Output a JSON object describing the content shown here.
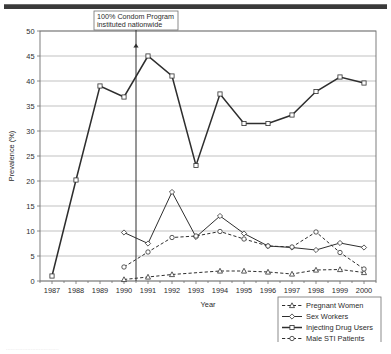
{
  "figure": {
    "top_rule": "horizontal-rule",
    "caption_fragment": "................................"
  },
  "chart_data": {
    "type": "line",
    "title": "",
    "xlabel": "Year",
    "ylabel": "Prevalence (%)",
    "x": [
      1987,
      1988,
      1989,
      1990,
      1991,
      1992,
      1993,
      1994,
      1995,
      1996,
      1997,
      1998,
      1999,
      2000
    ],
    "xtick_labels": [
      "1987",
      "1988",
      "1989",
      "1990",
      "1991",
      "1992",
      "1993",
      "1994",
      "1995",
      "1996",
      "1997",
      "1998",
      "1999",
      "2000"
    ],
    "ylim": [
      0,
      50
    ],
    "ytick_values": [
      0,
      5,
      10,
      15,
      20,
      25,
      30,
      35,
      40,
      45,
      50
    ],
    "ytick_labels": [
      "0",
      "5",
      "10",
      "15",
      "20",
      "25",
      "30",
      "35",
      "40",
      "45",
      "50"
    ],
    "grid": "horizontal",
    "legend_position": "bottom-right",
    "series": [
      {
        "name": "Pregnant Women",
        "marker": "triangle",
        "dash": "dashed",
        "x": [
          1990,
          1991,
          1992,
          1994,
          1995,
          1996,
          1997,
          1998,
          1999,
          2000
        ],
        "values": [
          0.3,
          0.8,
          1.3,
          2.0,
          2.0,
          1.8,
          1.4,
          2.2,
          2.3,
          1.7
        ]
      },
      {
        "name": "Sex Workers",
        "marker": "diamond",
        "dash": "solid",
        "x": [
          1990,
          1991,
          1992,
          1993,
          1994,
          1995,
          1996,
          1997,
          1998,
          1999,
          2000
        ],
        "values": [
          9.7,
          7.5,
          17.8,
          8.8,
          13.0,
          9.5,
          7.0,
          6.7,
          6.2,
          7.6,
          6.7
        ]
      },
      {
        "name": "Injecting Drug Users",
        "marker": "square",
        "dash": "solid",
        "x": [
          1987,
          1988,
          1989,
          1990,
          1991,
          1992,
          1993,
          1994,
          1995,
          1996,
          1997,
          1998,
          1999,
          2000
        ],
        "values": [
          1.0,
          20.2,
          39.0,
          36.8,
          45.0,
          41.0,
          23.1,
          37.4,
          31.5,
          31.5,
          33.2,
          37.9,
          40.8,
          39.6
        ]
      },
      {
        "name": "Male STI Patients",
        "marker": "circle",
        "dash": "dashed",
        "x": [
          1990,
          1991,
          1992,
          1993,
          1994,
          1995,
          1996,
          1997,
          1998,
          1999,
          2000
        ],
        "values": [
          2.8,
          5.8,
          8.7,
          9.0,
          9.9,
          8.4,
          7.0,
          6.8,
          9.8,
          5.7,
          2.4
        ]
      }
    ],
    "annotations": [
      {
        "id": "condom-program",
        "line1": "100% Condom Program",
        "line2": "instituted nationwide",
        "points_to_x": 1990.5,
        "points_to_y": 47.5
      }
    ]
  }
}
